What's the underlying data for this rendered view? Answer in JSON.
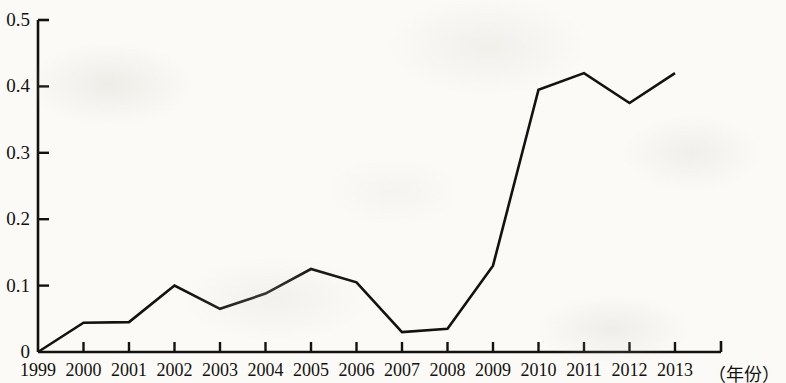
{
  "chart_data": {
    "type": "line",
    "title": "",
    "subtitle": "",
    "xlabel": "（年份）",
    "ylabel": "",
    "categories": [
      "1999",
      "2000",
      "2001",
      "2002",
      "2003",
      "2004",
      "2005",
      "2006",
      "2007",
      "2008",
      "2009",
      "2010",
      "2011",
      "2012",
      "2013"
    ],
    "values": [
      0.0,
      0.044,
      0.045,
      0.1,
      0.065,
      0.088,
      0.125,
      0.105,
      0.03,
      0.035,
      0.13,
      0.395,
      0.42,
      0.375,
      0.42
    ],
    "series": [
      {
        "name": "",
        "values": [
          0.0,
          0.044,
          0.045,
          0.1,
          0.065,
          0.088,
          0.125,
          0.105,
          0.03,
          0.035,
          0.13,
          0.395,
          0.42,
          0.375,
          0.42
        ]
      }
    ],
    "x_tick_labels": [
      "1999",
      "2000",
      "2001",
      "2002",
      "2003",
      "2004",
      "2005",
      "2006",
      "2007",
      "2008",
      "2009",
      "2010",
      "2011",
      "2012",
      "2013"
    ],
    "y_tick_labels": [
      "0",
      "0.1",
      "0.2",
      "0.3",
      "0.4",
      "0.5"
    ],
    "y_tick_values": [
      0,
      0.1,
      0.2,
      0.3,
      0.4,
      0.5
    ],
    "ylim": [
      0,
      0.5
    ],
    "grid": false,
    "legend": false,
    "legend_position": "none",
    "line_color": "#141210",
    "axis_color": "#141210",
    "background_color": "#fbfaf7",
    "annotations": []
  },
  "axis": {
    "x_label_text": "（年份）"
  }
}
